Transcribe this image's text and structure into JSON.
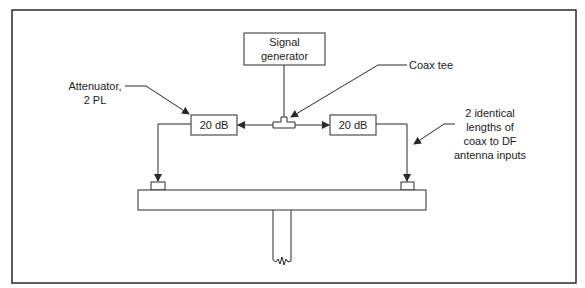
{
  "diagram": {
    "type": "block-diagram",
    "colors": {
      "line": "#2a2a2a",
      "background": "#ffffff"
    },
    "blocks": {
      "signal_generator": {
        "line1": "Signal",
        "line2": "generator"
      },
      "attenuator_left": {
        "label": "20 dB"
      },
      "attenuator_right": {
        "label": "20 dB"
      },
      "coax_tee": {
        "label": ""
      },
      "antenna_boom": {
        "label": ""
      }
    },
    "callouts": {
      "attenuator": {
        "line1": "Attenuator,",
        "line2": "2 PL"
      },
      "coax_tee": {
        "text": "Coax tee"
      },
      "coax_lengths": {
        "line1": "2 identical",
        "line2": "lengths of",
        "line3": "coax to DF",
        "line4": "antenna inputs"
      }
    }
  }
}
